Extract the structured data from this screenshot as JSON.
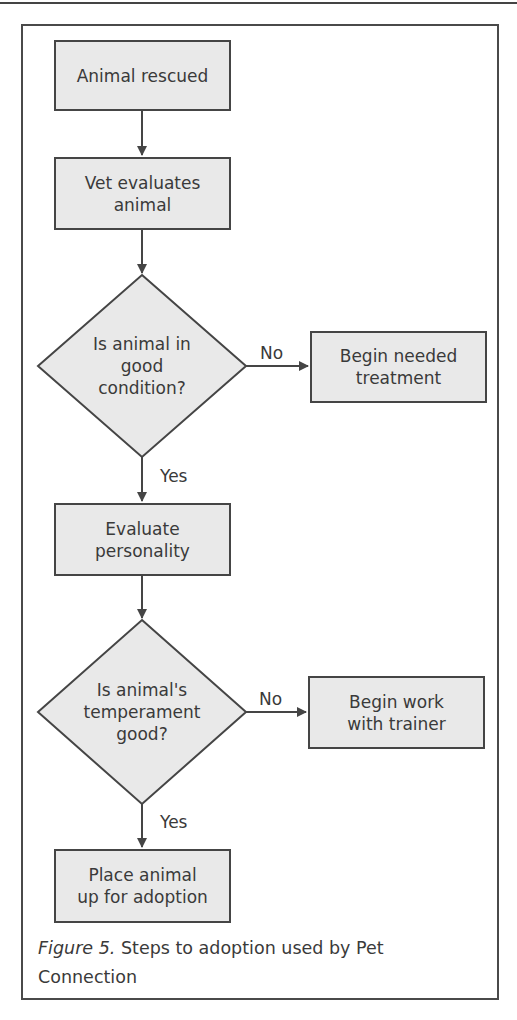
{
  "diagram": {
    "type": "flowchart",
    "nodes": {
      "animal_rescued": "Animal rescued",
      "vet_evaluates": "Vet evaluates\nanimal",
      "decision_condition": "Is animal in\ngood\ncondition?",
      "begin_treatment": "Begin needed\ntreatment",
      "evaluate_personality": "Evaluate\npersonality",
      "decision_temperament": "Is animal's\ntemperament\ngood?",
      "begin_trainer": "Begin work\nwith trainer",
      "place_adoption": "Place animal\nup for adoption"
    },
    "edge_labels": {
      "condition_no": "No",
      "condition_yes": "Yes",
      "temperament_no": "No",
      "temperament_yes": "Yes"
    },
    "edges": [
      {
        "from": "Animal rescued",
        "to": "Vet evaluates animal"
      },
      {
        "from": "Vet evaluates animal",
        "to": "Is animal in good condition?"
      },
      {
        "from": "Is animal in good condition?",
        "to": "Begin needed treatment",
        "label": "No"
      },
      {
        "from": "Is animal in good condition?",
        "to": "Evaluate personality",
        "label": "Yes"
      },
      {
        "from": "Evaluate personality",
        "to": "Is animal's temperament good?"
      },
      {
        "from": "Is animal's temperament good?",
        "to": "Begin work with trainer",
        "label": "No"
      },
      {
        "from": "Is animal's temperament good?",
        "to": "Place animal up for adoption",
        "label": "Yes"
      }
    ]
  },
  "caption": {
    "figure_label": "Figure 5.",
    "text": " Steps to adoption used by Pet Connection"
  },
  "colors": {
    "box_fill": "#e9e9e9",
    "stroke": "#454545",
    "text": "#3a3a3a"
  }
}
